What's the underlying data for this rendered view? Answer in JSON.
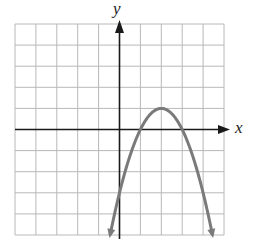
{
  "graph": {
    "x_axis_label": "x",
    "y_axis_label": "y",
    "grid": {
      "x_min": -5,
      "x_max": 5,
      "y_min": -5,
      "y_max": 5,
      "step": 1
    },
    "colors": {
      "grid": "#b8b8b8",
      "axis": "#1a1a1a",
      "curve": "#7a7a7a",
      "background": "#ffffff"
    }
  },
  "chart_data": {
    "type": "line",
    "title": "",
    "xlabel": "x",
    "ylabel": "y",
    "xlim": [
      -5,
      5
    ],
    "ylim": [
      -5,
      5
    ],
    "grid": true,
    "function": "y = -(x - 2)^2 + 1",
    "features": {
      "vertex": [
        2,
        1
      ],
      "x_intercepts": [
        1,
        3
      ],
      "y_intercept": -3,
      "opens": "down",
      "arrows_on_ends": true
    },
    "series": [
      {
        "name": "parabola",
        "x": [
          -0.45,
          0,
          0.5,
          1,
          1.5,
          2,
          2.5,
          3,
          3.5,
          4,
          4.45
        ],
        "values": [
          -5,
          -3,
          -1.25,
          0,
          0.75,
          1,
          0.75,
          0,
          -1.25,
          -3,
          -5
        ]
      }
    ]
  }
}
